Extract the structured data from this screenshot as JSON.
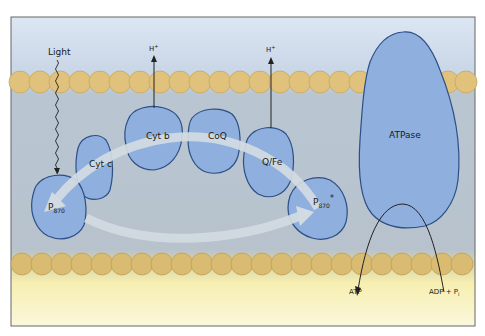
{
  "diagram": {
    "labels": {
      "light": "Light",
      "h_plus_1": "H",
      "h_plus_1_sup": "+",
      "h_plus_2": "H",
      "h_plus_2_sup": "+",
      "cyt_c": "Cyt c",
      "cyt_b": "Cyt b",
      "coq": "CoQ",
      "qfe": "Q/Fe",
      "p870_ground": "P",
      "p870_ground_sub": "870",
      "p870_excited": "P",
      "p870_excited_sub": "870",
      "p870_excited_sup": "*",
      "atpase": "ATPase",
      "atp": "ATP",
      "adp_pi": "ADP + P",
      "adp_pi_sub": "i"
    },
    "colors": {
      "protein_fill": "#8fb0de",
      "protein_stroke": "#2d4f86",
      "lipid_head": "#e3c47a",
      "lipid_stroke": "#c9a75a",
      "membrane_interior": "#bcc7d0",
      "top_bg": "#cfdcec",
      "bottom_bg": "#f8f2b8",
      "arrow_band": "#d5dde4",
      "frame": "#555555"
    }
  }
}
